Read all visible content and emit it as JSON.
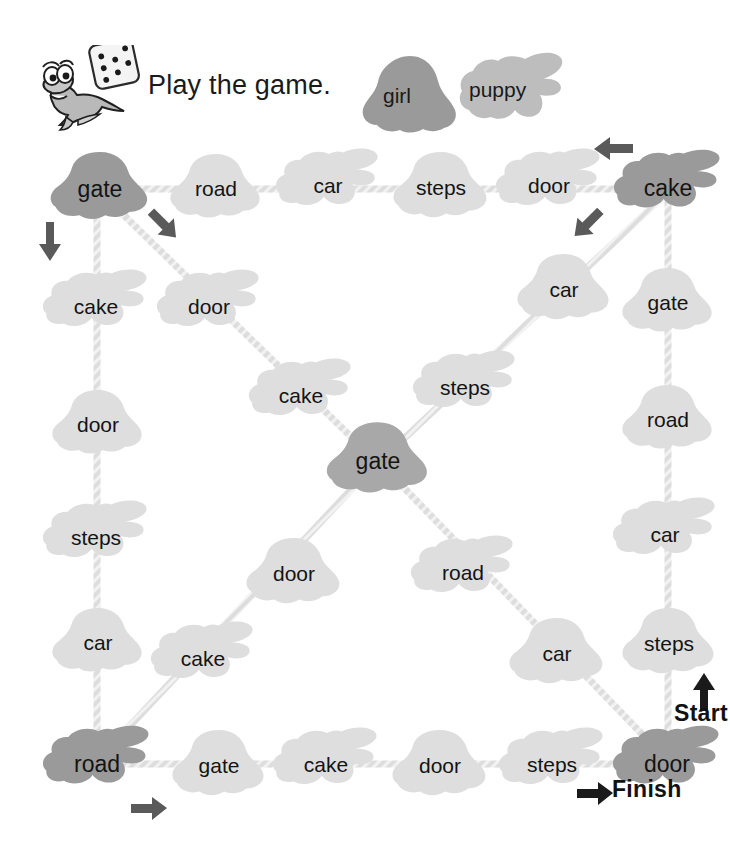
{
  "header": {
    "instruction": "Play the game.",
    "mascot_icon": "dinosaur-mascot-icon",
    "dice_icon": "die-icon"
  },
  "legend": {
    "items": [
      {
        "label": "girl",
        "token": "girl-token",
        "shape": "girl",
        "color": "#9a9a9a"
      },
      {
        "label": "puppy",
        "token": "puppy-token",
        "shape": "puppy",
        "color": "#bdbdbd"
      }
    ]
  },
  "colors": {
    "corner_node": "#9a9a9a",
    "center_node": "#a8a8a8",
    "path_node": "#dedede",
    "path_line": "#d6d6d6",
    "arrow": "#5a5a5a",
    "text": "#141414"
  },
  "markers": {
    "start_label": "Start",
    "finish_label": "Finish",
    "arrows": [
      {
        "name": "arrow-down-left-corner",
        "direction": "down"
      },
      {
        "name": "arrow-diagonal-from-top-left",
        "direction": "down-right"
      },
      {
        "name": "arrow-left-top-right",
        "direction": "left"
      },
      {
        "name": "arrow-diagonal-from-top-right",
        "direction": "down-left"
      },
      {
        "name": "arrow-right-bottom-left",
        "direction": "right"
      },
      {
        "name": "arrow-start",
        "direction": "up"
      },
      {
        "name": "arrow-finish",
        "direction": "right"
      }
    ]
  },
  "board": {
    "top_row": [
      "gate",
      "road",
      "car",
      "steps",
      "door",
      "cake"
    ],
    "right_col": [
      "gate",
      "road",
      "car",
      "steps"
    ],
    "bottom_row": [
      "road",
      "gate",
      "cake",
      "door",
      "steps",
      "door"
    ],
    "left_col": [
      "cake",
      "door",
      "steps",
      "car"
    ],
    "center": "gate",
    "diag_top_left": [
      "door",
      "cake"
    ],
    "diag_top_right": [
      "car",
      "steps"
    ],
    "diag_bottom_left": [
      "door",
      "cake"
    ],
    "diag_bottom_right": [
      "road",
      "car"
    ],
    "nodes": [
      {
        "id": "n-tl",
        "label": "gate",
        "shape": "girl",
        "tone": "corner",
        "x": 46,
        "y": 148,
        "w": 108,
        "h": 82
      },
      {
        "id": "n-top-1",
        "label": "road",
        "shape": "girl",
        "tone": "light",
        "x": 166,
        "y": 150,
        "w": 100,
        "h": 78
      },
      {
        "id": "n-top-2",
        "label": "car",
        "shape": "puppy",
        "tone": "light",
        "x": 275,
        "y": 145,
        "w": 106,
        "h": 82
      },
      {
        "id": "n-top-3",
        "label": "steps",
        "shape": "girl",
        "tone": "light",
        "x": 389,
        "y": 148,
        "w": 104,
        "h": 80
      },
      {
        "id": "n-top-4",
        "label": "door",
        "shape": "puppy",
        "tone": "light",
        "x": 495,
        "y": 145,
        "w": 108,
        "h": 82
      },
      {
        "id": "n-tr",
        "label": "cake",
        "shape": "puppy",
        "tone": "corner",
        "x": 613,
        "y": 146,
        "w": 110,
        "h": 84
      },
      {
        "id": "n-r-1",
        "label": "gate",
        "shape": "girl",
        "tone": "light",
        "x": 618,
        "y": 264,
        "w": 100,
        "h": 78
      },
      {
        "id": "n-r-2",
        "label": "road",
        "shape": "girl",
        "tone": "light",
        "x": 618,
        "y": 381,
        "w": 100,
        "h": 78
      },
      {
        "id": "n-r-3",
        "label": "car",
        "shape": "puppy",
        "tone": "light",
        "x": 612,
        "y": 494,
        "w": 106,
        "h": 82
      },
      {
        "id": "n-r-4",
        "label": "steps",
        "shape": "girl",
        "tone": "light",
        "x": 618,
        "y": 604,
        "w": 102,
        "h": 80
      },
      {
        "id": "n-br",
        "label": "door",
        "shape": "puppy",
        "tone": "corner",
        "x": 612,
        "y": 722,
        "w": 110,
        "h": 84
      },
      {
        "id": "n-bot-4",
        "label": "steps",
        "shape": "puppy",
        "tone": "light",
        "x": 498,
        "y": 724,
        "w": 108,
        "h": 82
      },
      {
        "id": "n-bot-3",
        "label": "door",
        "shape": "girl",
        "tone": "light",
        "x": 388,
        "y": 726,
        "w": 104,
        "h": 80
      },
      {
        "id": "n-bot-2",
        "label": "cake",
        "shape": "puppy",
        "tone": "light",
        "x": 272,
        "y": 724,
        "w": 108,
        "h": 82
      },
      {
        "id": "n-bot-1",
        "label": "gate",
        "shape": "girl",
        "tone": "light",
        "x": 168,
        "y": 726,
        "w": 102,
        "h": 80
      },
      {
        "id": "n-bl",
        "label": "road",
        "shape": "puppy",
        "tone": "corner",
        "x": 42,
        "y": 722,
        "w": 110,
        "h": 84
      },
      {
        "id": "n-l-4",
        "label": "car",
        "shape": "girl",
        "tone": "light",
        "x": 48,
        "y": 604,
        "w": 100,
        "h": 78
      },
      {
        "id": "n-l-3",
        "label": "steps",
        "shape": "puppy",
        "tone": "light",
        "x": 42,
        "y": 497,
        "w": 108,
        "h": 82
      },
      {
        "id": "n-l-2",
        "label": "door",
        "shape": "girl",
        "tone": "light",
        "x": 48,
        "y": 386,
        "w": 100,
        "h": 78
      },
      {
        "id": "n-l-1",
        "label": "cake",
        "shape": "puppy",
        "tone": "light",
        "x": 42,
        "y": 266,
        "w": 108,
        "h": 82
      },
      {
        "id": "n-c",
        "label": "gate",
        "shape": "girl",
        "tone": "center",
        "x": 322,
        "y": 418,
        "w": 112,
        "h": 86
      },
      {
        "id": "n-dtl-1",
        "label": "door",
        "shape": "puppy",
        "tone": "light",
        "x": 156,
        "y": 266,
        "w": 106,
        "h": 82
      },
      {
        "id": "n-dtl-2",
        "label": "cake",
        "shape": "puppy",
        "tone": "light",
        "x": 248,
        "y": 355,
        "w": 106,
        "h": 82
      },
      {
        "id": "n-dtr-1",
        "label": "car",
        "shape": "girl",
        "tone": "light",
        "x": 513,
        "y": 250,
        "w": 102,
        "h": 80
      },
      {
        "id": "n-dtr-2",
        "label": "steps",
        "shape": "puppy",
        "tone": "light",
        "x": 412,
        "y": 347,
        "w": 106,
        "h": 82
      },
      {
        "id": "n-dbl-1",
        "label": "door",
        "shape": "girl",
        "tone": "light",
        "x": 242,
        "y": 534,
        "w": 104,
        "h": 80
      },
      {
        "id": "n-dbl-2",
        "label": "cake",
        "shape": "puppy",
        "tone": "light",
        "x": 150,
        "y": 618,
        "w": 106,
        "h": 82
      },
      {
        "id": "n-dbr-1",
        "label": "road",
        "shape": "puppy",
        "tone": "light",
        "x": 410,
        "y": 532,
        "w": 106,
        "h": 82
      },
      {
        "id": "n-dbr-2",
        "label": "car",
        "shape": "girl",
        "tone": "light",
        "x": 505,
        "y": 614,
        "w": 104,
        "h": 80
      }
    ]
  }
}
